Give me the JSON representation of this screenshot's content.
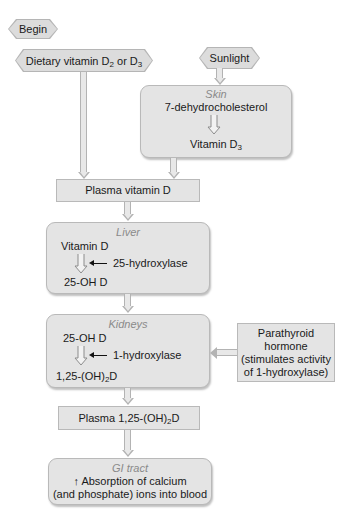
{
  "nodes": {
    "begin": {
      "label": "Begin"
    },
    "dietary": {
      "label_main": "Dietary vitamin D",
      "sub1": "2",
      "mid": " or D",
      "sub2": "3"
    },
    "sunlight": {
      "label": "Sunlight"
    },
    "skin": {
      "organ": "Skin",
      "from": "7-dehydrocholesterol",
      "to_main": "Vitamin D",
      "to_sub": "3"
    },
    "plasma_vit_d": {
      "label": "Plasma vitamin D"
    },
    "liver": {
      "organ": "Liver",
      "from": "Vitamin D",
      "enzyme": "25-hydroxylase",
      "to": "25-OH D"
    },
    "kidneys": {
      "organ": "Kidneys",
      "from": "25-OH D",
      "enzyme": "1-hydroxylase",
      "to_pre": "1,25-(OH)",
      "to_sub": "2",
      "to_post": "D"
    },
    "pth": {
      "line1": "Parathyroid",
      "line2": "hormone",
      "line3": "(stimulates activity",
      "line4": "of 1-hydroxylase)"
    },
    "plasma_125": {
      "pre": "Plasma 1,25-(OH)",
      "sub": "2",
      "post": "D"
    },
    "gi": {
      "organ": "GI tract",
      "line1": "↑ Absorption of calcium",
      "line2": "(and phosphate) ions into blood"
    }
  },
  "colors": {
    "box_fill": "#e4e4e4",
    "box_border": "#b9b9b9",
    "organ_label": "#8a8a8a",
    "text": "#1a1a1a"
  }
}
